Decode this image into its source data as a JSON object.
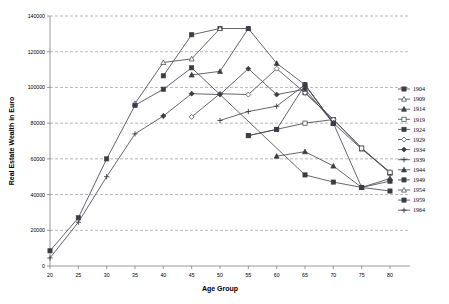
{
  "chart_data": {
    "type": "line",
    "title": "",
    "xlabel": "Age Group",
    "ylabel": "Real Estate Wealth in Euro",
    "xlim": [
      20,
      80
    ],
    "ylim": [
      0,
      140000
    ],
    "xticks": [
      20,
      25,
      30,
      35,
      40,
      45,
      50,
      55,
      60,
      65,
      70,
      75,
      80
    ],
    "yticks": [
      0,
      20000,
      40000,
      60000,
      80000,
      100000,
      120000,
      140000
    ],
    "grid": "horizontal-dashed",
    "legend_position": "right",
    "series": [
      {
        "name": "1904",
        "marker": "filled-square",
        "x": [
          65,
          70,
          75,
          80
        ],
        "y": [
          97000,
          82000,
          66000,
          52000
        ]
      },
      {
        "name": "1909",
        "marker": "open-triangle",
        "x": [
          65,
          70,
          75,
          80
        ],
        "y": [
          99000,
          80000,
          65500,
          52500
        ]
      },
      {
        "name": "1914",
        "marker": "filled-triangle",
        "x": [
          60,
          65,
          70,
          75,
          80
        ],
        "y": [
          61500,
          64000,
          56000,
          44000,
          49000
        ]
      },
      {
        "name": "1919",
        "marker": "open-square",
        "x": [
          55,
          60,
          65,
          70,
          75,
          80
        ],
        "y": [
          73000,
          76500,
          80000,
          82000,
          66000,
          52500
        ]
      },
      {
        "name": "1924",
        "marker": "filled-square",
        "x": [
          55,
          60,
          65,
          70,
          75,
          80
        ],
        "y": [
          73000,
          76500,
          101500,
          80000,
          44000,
          47500
        ]
      },
      {
        "name": "1929",
        "marker": "open-diamond",
        "x": [
          45,
          50,
          55,
          60,
          65,
          70
        ],
        "y": [
          83500,
          96500,
          96000,
          110500,
          97000,
          82000
        ]
      },
      {
        "name": "1934",
        "marker": "filled-diamond",
        "x": [
          40,
          45,
          50,
          55,
          60,
          65
        ],
        "y": [
          84000,
          96500,
          96000,
          110500,
          96000,
          99000
        ]
      },
      {
        "name": "1939",
        "marker": "plus",
        "x": [
          50,
          55,
          60,
          65,
          70
        ],
        "y": [
          81500,
          86500,
          89500,
          101500,
          80000
        ]
      },
      {
        "name": "1944",
        "marker": "filled-triangle",
        "x": [
          45,
          50,
          55,
          60,
          65,
          70
        ],
        "y": [
          107000,
          109000,
          133000,
          113500,
          101500,
          80000
        ]
      },
      {
        "name": "1949",
        "marker": "filled-square",
        "x": [
          40,
          45,
          50,
          55
        ],
        "y": [
          106500,
          129500,
          133000,
          133000
        ]
      },
      {
        "name": "1954",
        "marker": "open-triangle",
        "x": [
          35,
          40,
          45,
          50
        ],
        "y": [
          91000,
          114000,
          116000,
          133000
        ]
      },
      {
        "name": "1959",
        "marker": "filled-square",
        "x": [
          20,
          25,
          30,
          35,
          40,
          45,
          65,
          70,
          75,
          80
        ],
        "y": [
          8500,
          27000,
          60000,
          90000,
          99000,
          111000,
          51000,
          47000,
          44000,
          42000
        ]
      },
      {
        "name": "1964",
        "marker": "plus",
        "x": [
          20,
          25,
          30,
          35,
          40
        ],
        "y": [
          4500,
          24500,
          50000,
          74000,
          84000
        ]
      }
    ],
    "legend_entries": [
      "1904",
      "1909",
      "1914",
      "1919",
      "1924",
      "1929",
      "1934",
      "1939",
      "1944",
      "1949",
      "1954",
      "1959",
      "1964"
    ],
    "colors": {
      "line": "#4a4a55",
      "grid": "#9a9a9a",
      "axis": "#808080",
      "text": "#000000"
    }
  }
}
